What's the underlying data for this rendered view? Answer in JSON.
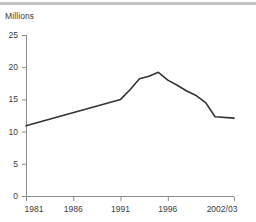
{
  "chart_data": {
    "type": "line",
    "title": "",
    "subtitle": "",
    "ylabel": "Millions",
    "xlabel": "",
    "ylim": [
      0,
      25
    ],
    "yticks": [
      0,
      5,
      10,
      15,
      20,
      25
    ],
    "ytick_labels": [
      "0",
      "5",
      "10",
      "15",
      "20",
      "25"
    ],
    "xlim": [
      1981,
      2003
    ],
    "xticks": [
      1981,
      1986,
      1991,
      1996,
      2003
    ],
    "xtick_labels": [
      "1981",
      "1986",
      "1991",
      "1996",
      "2002/03"
    ],
    "grid": false,
    "legend": null,
    "line_color": "#333333",
    "line_width": 1.6,
    "x": [
      1981,
      1991,
      1992,
      1993,
      1994,
      1995,
      1996,
      1997,
      1998,
      1999,
      2000,
      2001,
      2003
    ],
    "values": [
      10.9,
      15.0,
      16.5,
      18.2,
      18.6,
      19.2,
      18.0,
      17.2,
      16.3,
      15.6,
      14.5,
      12.3,
      12.1
    ],
    "series": [
      {
        "name": "Millions",
        "values": [
          10.9,
          15.0,
          16.5,
          18.2,
          18.6,
          19.2,
          18.0,
          17.2,
          16.3,
          15.6,
          14.5,
          12.3,
          12.1
        ]
      }
    ],
    "annotations": []
  },
  "colors": {
    "top_rule": "#c3c3c5",
    "axis": "#8c8c8e",
    "text": "#3b3b3d",
    "line": "#333333"
  }
}
